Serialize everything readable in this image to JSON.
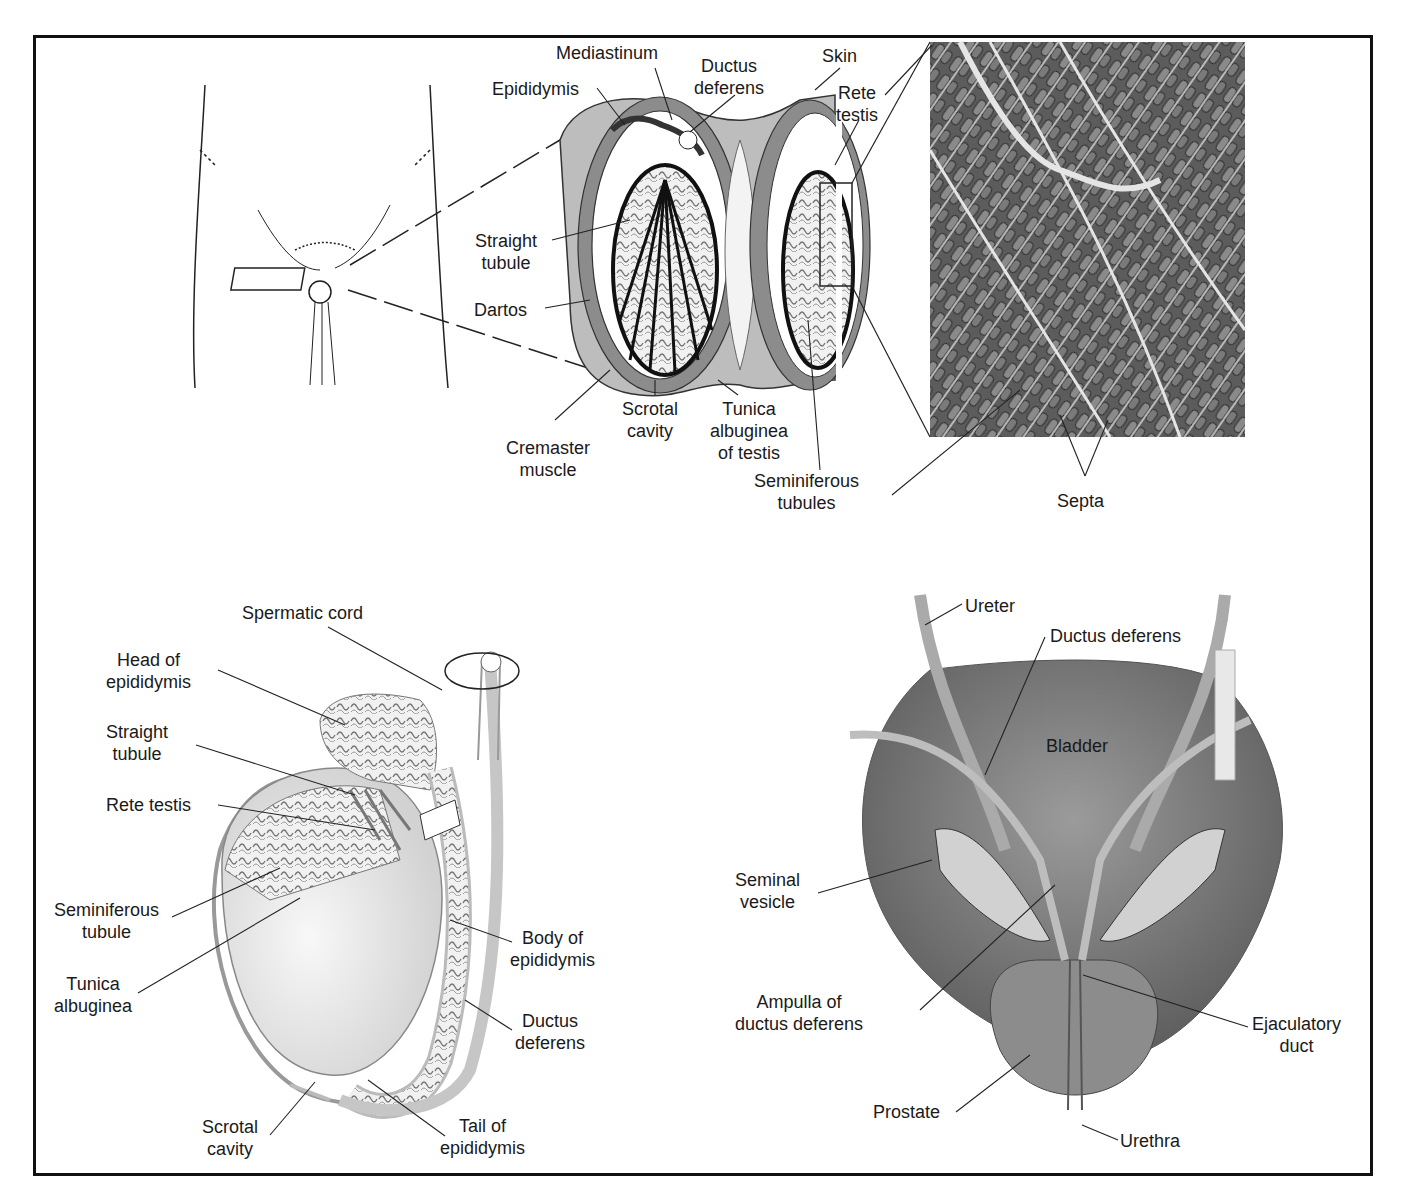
{
  "figure": {
    "panels": [
      {
        "id": "scrotum-cross-section",
        "labels": {
          "mediastinum": "Mediastinum",
          "ductus_deferens": "Ductus\ndeferens",
          "skin": "Skin",
          "epididymis": "Epididymis",
          "rete_testis": "Rete\ntestis",
          "straight_tubule": "Straight\ntubule",
          "dartos": "Dartos",
          "cremaster_muscle": "Cremaster\nmuscle",
          "scrotal_cavity": "Scrotal\ncavity",
          "tunica_albuginea": "Tunica\nalbuginea\nof testis",
          "seminiferous_tubules": "Seminiferous\ntubules",
          "septa": "Septa"
        }
      },
      {
        "id": "testis-epididymis",
        "labels": {
          "spermatic_cord": "Spermatic cord",
          "head_of_epididymis": "Head of\nepididymis",
          "straight_tubule": "Straight\ntubule",
          "rete_testis": "Rete testis",
          "seminiferous_tubule": "Seminiferous\ntubule",
          "tunica_albuginea": "Tunica\nalbuginea",
          "body_of_epididymis": "Body of\nepididymis",
          "ductus_deferens": "Ductus\ndeferens",
          "scrotal_cavity": "Scrotal\ncavity",
          "tail_of_epididymis": "Tail of\nepididymis"
        }
      },
      {
        "id": "bladder-posterior",
        "labels": {
          "ureter": "Ureter",
          "ductus_deferens": "Ductus deferens",
          "bladder": "Bladder",
          "seminal_vesicle": "Seminal\nvesicle",
          "ampulla": "Ampulla of\nductus deferens",
          "ejaculatory_duct": "Ejaculatory\nduct",
          "prostate": "Prostate",
          "urethra": "Urethra"
        }
      }
    ],
    "colors": {
      "line": "#1a1a1a",
      "frame": "#111111",
      "tissue_light": "#e6e6e6",
      "tissue_mid": "#9a9a9a",
      "tissue_dark": "#4a4a4a",
      "micrograph_bg": "#6b6b6b"
    }
  }
}
